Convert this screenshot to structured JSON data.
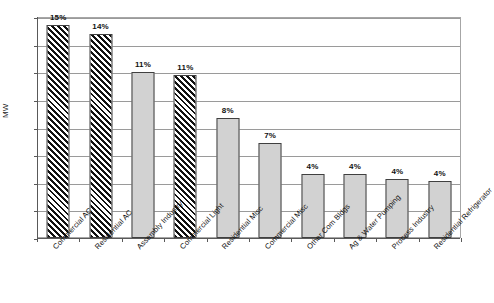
{
  "chart_data": {
    "type": "bar",
    "title": "",
    "xlabel": "",
    "ylabel": "MW",
    "ylim": [
      0,
      8000
    ],
    "ytick_values": [
      0,
      1000,
      2000,
      3000,
      4000,
      5000,
      6000,
      7000,
      8000
    ],
    "ytick_labels": [
      "0",
      "1,000",
      "2,000",
      "3,000",
      "4,000",
      "5,000",
      "6,000",
      "7,000",
      "8,000"
    ],
    "grid": true,
    "legend": "none",
    "categories": [
      "Commercial AC",
      "Residential AC",
      "Assembly Industry",
      "Commercial Light",
      "Residential Misc",
      "Commercial Misc",
      "Other Com Bldgs",
      "Ag & Water Pumping",
      "Process Industry",
      "Residential Refrigerator"
    ],
    "values": [
      7700,
      7380,
      6000,
      5900,
      4350,
      3450,
      2300,
      2300,
      2150,
      2070
    ],
    "data_labels": [
      "15%",
      "14%",
      "11%",
      "11%",
      "8%",
      "7%",
      "4%",
      "4%",
      "4%",
      "4%"
    ],
    "bar_styles": [
      "hatch",
      "hatch",
      "solid",
      "hatch",
      "solid",
      "solid",
      "solid",
      "solid",
      "solid",
      "solid"
    ],
    "colors": {
      "solid_fill": "#d2d2d2",
      "hatch_fill": "#ffffff",
      "hatch_stroke": "#111111",
      "bar_border": "#404040",
      "gridline": "#9a9a9a",
      "axis": "#595959",
      "text": "#111111",
      "background": "#ffffff"
    }
  }
}
